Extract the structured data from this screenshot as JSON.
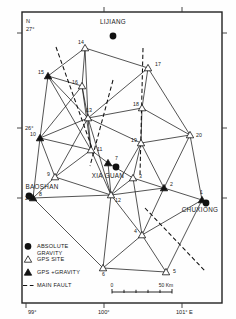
{
  "figure": {
    "type": "map",
    "frame": {
      "x": 22,
      "y": 12,
      "width": 200,
      "height": 291
    }
  },
  "axes": {
    "north_marker": "N",
    "latitude_ticks": [
      {
        "label": "27°",
        "y": 33
      },
      {
        "label": "26°",
        "y": 128
      },
      {
        "label": "25°",
        "y": 198
      }
    ],
    "longitude_ticks": [
      {
        "label": "99°",
        "x": 26
      },
      {
        "label": "100°",
        "x": 104
      },
      {
        "label": "101° E",
        "x": 182
      }
    ]
  },
  "cities": [
    {
      "name": "LIJIANG",
      "label_x": 113,
      "label_y": 24,
      "dot_x": 113,
      "dot_y": 36,
      "symbol": "absolute-gravity"
    },
    {
      "name": "XIA GUAN",
      "label_x": 108,
      "label_y": 178,
      "dot_x": 116,
      "dot_y": 167,
      "symbol": "absolute-gravity"
    },
    {
      "name": "BAOSHAN",
      "label_x": 42,
      "label_y": 189,
      "dot_x": 29,
      "dot_y": 196,
      "symbol": "absolute-gravity"
    },
    {
      "name": "CHUXIONG",
      "label_x": 200,
      "label_y": 212,
      "dot_x": 206,
      "dot_y": 203,
      "symbol": "absolute-gravity"
    }
  ],
  "sites": [
    {
      "id": "1",
      "x": 202,
      "y": 200,
      "type": "gps-gravity",
      "label_dx": -2,
      "label_dy": -6
    },
    {
      "id": "2",
      "x": 164,
      "y": 188,
      "type": "gps-gravity",
      "label_dx": 6,
      "label_dy": -2
    },
    {
      "id": "3",
      "x": 133,
      "y": 178,
      "type": "gps-site",
      "label_dx": 6,
      "label_dy": 0
    },
    {
      "id": "4",
      "x": 142,
      "y": 235,
      "type": "gps-site",
      "label_dx": -8,
      "label_dy": -2
    },
    {
      "id": "5",
      "x": 166,
      "y": 272,
      "type": "gps-site",
      "label_dx": 7,
      "label_dy": 1
    },
    {
      "id": "6",
      "x": 103,
      "y": 268,
      "type": "gps-site",
      "label_dx": -1,
      "label_dy": 8
    },
    {
      "id": "7",
      "x": 108,
      "y": 163,
      "type": "gps-gravity",
      "label_dx": 7,
      "label_dy": -3
    },
    {
      "id": "8",
      "x": 33,
      "y": 198,
      "type": "gps-gravity",
      "label_dx": 6,
      "label_dy": -2
    },
    {
      "id": "9",
      "x": 55,
      "y": 177,
      "type": "gps-site",
      "label_dx": -8,
      "label_dy": -1
    },
    {
      "id": "10",
      "x": 40,
      "y": 138,
      "type": "gps-gravity",
      "label_dx": -10,
      "label_dy": -2
    },
    {
      "id": "11",
      "x": 91,
      "y": 150,
      "type": "gps-site",
      "label_dx": 6,
      "label_dy": 1
    },
    {
      "id": "12",
      "x": 111,
      "y": 195,
      "type": "gps-site",
      "label_dx": 4,
      "label_dy": 7
    },
    {
      "id": "13",
      "x": 88,
      "y": 118,
      "type": "gps-site",
      "label_dx": -2,
      "label_dy": -6
    },
    {
      "id": "14",
      "x": 85,
      "y": 48,
      "type": "gps-site",
      "label_dx": -7,
      "label_dy": -4
    },
    {
      "id": "15",
      "x": 48,
      "y": 76,
      "type": "gps-gravity",
      "label_dx": -10,
      "label_dy": -2
    },
    {
      "id": "16",
      "x": 82,
      "y": 86,
      "type": "gps-site",
      "label_dx": -10,
      "label_dy": -2
    },
    {
      "id": "17",
      "x": 148,
      "y": 68,
      "type": "gps-site",
      "label_dx": 7,
      "label_dy": -2
    },
    {
      "id": "18",
      "x": 142,
      "y": 108,
      "type": "gps-site",
      "label_dx": -9,
      "label_dy": -2
    },
    {
      "id": "19",
      "x": 141,
      "y": 143,
      "type": "gps-site",
      "label_dx": -10,
      "label_dy": -1
    },
    {
      "id": "20",
      "x": 190,
      "y": 135,
      "type": "gps-site",
      "label_dx": 6,
      "label_dy": 2
    }
  ],
  "network_edges": [
    [
      "14",
      "15"
    ],
    [
      "14",
      "16"
    ],
    [
      "14",
      "13"
    ],
    [
      "14",
      "17"
    ],
    [
      "15",
      "16"
    ],
    [
      "15",
      "13"
    ],
    [
      "15",
      "10"
    ],
    [
      "15",
      "11"
    ],
    [
      "16",
      "13"
    ],
    [
      "16",
      "11"
    ],
    [
      "16",
      "10"
    ],
    [
      "17",
      "18"
    ],
    [
      "17",
      "13"
    ],
    [
      "17",
      "20"
    ],
    [
      "18",
      "13"
    ],
    [
      "18",
      "19"
    ],
    [
      "18",
      "20"
    ],
    [
      "19",
      "20"
    ],
    [
      "19",
      "3"
    ],
    [
      "19",
      "12"
    ],
    [
      "19",
      "2"
    ],
    [
      "20",
      "2"
    ],
    [
      "20",
      "1"
    ],
    [
      "13",
      "11"
    ],
    [
      "13",
      "10"
    ],
    [
      "13",
      "9"
    ],
    [
      "13",
      "12"
    ],
    [
      "13",
      "19"
    ],
    [
      "10",
      "11"
    ],
    [
      "10",
      "9"
    ],
    [
      "10",
      "8"
    ],
    [
      "11",
      "9"
    ],
    [
      "11",
      "12"
    ],
    [
      "11",
      "7"
    ],
    [
      "9",
      "12"
    ],
    [
      "9",
      "8"
    ],
    [
      "8",
      "12"
    ],
    [
      "8",
      "6"
    ],
    [
      "12",
      "3"
    ],
    [
      "12",
      "4"
    ],
    [
      "12",
      "6"
    ],
    [
      "12",
      "2"
    ],
    [
      "3",
      "2"
    ],
    [
      "3",
      "4"
    ],
    [
      "2",
      "1"
    ],
    [
      "2",
      "4"
    ],
    [
      "1",
      "4"
    ],
    [
      "1",
      "5"
    ],
    [
      "4",
      "5"
    ],
    [
      "4",
      "6"
    ],
    [
      "6",
      "5"
    ],
    [
      "7",
      "12"
    ],
    [
      "7",
      "3"
    ]
  ],
  "faults": [
    {
      "name": "fault-nw-1",
      "x1": 56,
      "y1": 47,
      "x2": 92,
      "y2": 148
    },
    {
      "name": "fault-nw-2",
      "x1": 113,
      "y1": 80,
      "x2": 90,
      "y2": 166
    },
    {
      "name": "fault-vertical-central",
      "x1": 143,
      "y1": 48,
      "x2": 140,
      "y2": 175
    },
    {
      "name": "fault-se-long",
      "x1": 145,
      "y1": 208,
      "x2": 206,
      "y2": 272
    }
  ],
  "legend": {
    "items": [
      {
        "symbol": "absolute-gravity",
        "label_line1": "ABSOLUTE",
        "label_line2": "GRAVITY"
      },
      {
        "symbol": "gps-site",
        "label_line1": "GPS  SITE",
        "label_line2": ""
      },
      {
        "symbol": "gps-gravity",
        "label_line1": "GPS +GRAVITY",
        "label_line2": ""
      },
      {
        "symbol": "main-fault",
        "label_line1": "MAIN FAULT",
        "label_line2": ""
      }
    ]
  },
  "scalebar": {
    "start_label": "0",
    "end_label": "50 Km",
    "x": 112,
    "y": 292,
    "length": 60
  }
}
